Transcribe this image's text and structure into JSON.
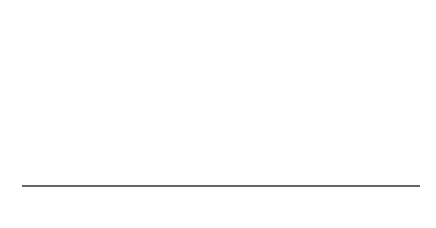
{
  "chart_data": {
    "type": "line",
    "title": "",
    "mean": 86,
    "std_dev": 4,
    "x_ticks": [
      "78",
      "82",
      "86",
      "90",
      "94"
    ],
    "region_labels": [
      "2.15%",
      "13.59",
      "34.13",
      "34.13",
      "13.59",
      "2.15%"
    ],
    "region_percentages": [
      2.15,
      13.59,
      34.13,
      34.13,
      13.59,
      2.15
    ],
    "xlabel": "",
    "ylabel": "",
    "grid": false,
    "legend": false
  },
  "colors": {
    "curve": "#111111",
    "lines": "#222222",
    "table_border": "#cccccc"
  }
}
